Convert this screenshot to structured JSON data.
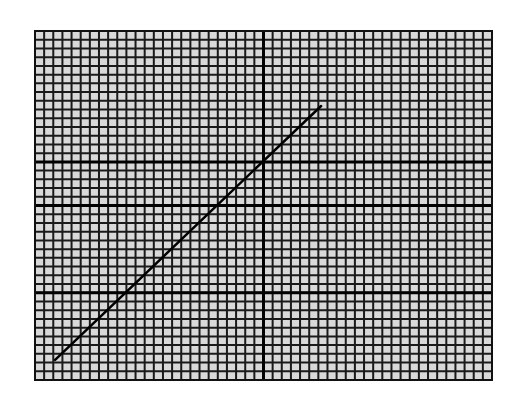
{
  "chart_data": {
    "type": "line",
    "title": "",
    "xlabel": "",
    "ylabel": "",
    "grid": true,
    "legend": null,
    "grid_spec": {
      "columns": 50,
      "rows": 40,
      "major_vertical_columns": [
        25
      ],
      "major_horizontal_rows": [
        10,
        20,
        25
      ]
    },
    "xlim": [
      0,
      50
    ],
    "ylim": [
      0,
      40
    ],
    "series": [
      {
        "name": "line",
        "x": [
          2.2,
          31.3
        ],
        "y": [
          2.3,
          31.4
        ]
      }
    ],
    "colors": {
      "background": "#ffffff",
      "grid_cell": "#d9d9d9",
      "grid_line": "#1a1a1a",
      "data_line": "#000000"
    }
  }
}
